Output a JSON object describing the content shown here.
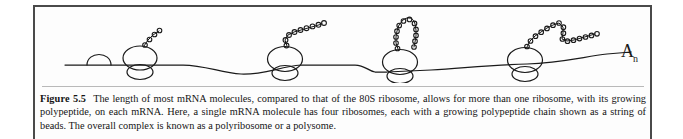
{
  "figure": {
    "label": "Figure 5.5",
    "caption_text": "The length of most mRNA molecules, compared to that of the 80S ribosome, allows for more than one ribosome, with its growing polypeptide, on each mRNA. Here, a single mRNA molecule has four ribosomes, each with a growing polypeptide chain shown as a string of beads. The overall complex is known as a polyribosome or a polysome.",
    "frame_color": "#4a4a4a",
    "rule_color": "#b9b9b9",
    "ink_color": "#1a1a1a",
    "page_background": "#fdfdfd"
  },
  "diagram": {
    "type": "polyribosome-schematic",
    "mrna_label_base": "A",
    "mrna_label_subscript": "n",
    "mrna_label_title": "poly-A tail",
    "initiation_dome_title": "small ribosomal subunit scanning mRNA",
    "mrna_strand_title": "mRNA strand",
    "ribosome_count": 4,
    "ribosomes": [
      {
        "name": "ribosome-1",
        "x": 105,
        "beads": 4,
        "chain_shape": "short-diagonal",
        "title": "80S ribosome with short growing polypeptide"
      },
      {
        "name": "ribosome-2",
        "x": 250,
        "beads": 9,
        "chain_shape": "long-diagonal",
        "title": "80S ribosome with longer growing polypeptide"
      },
      {
        "name": "ribosome-3",
        "x": 365,
        "beads": 12,
        "chain_shape": "hairpin-fold",
        "title": "80S ribosome with folded growing polypeptide"
      },
      {
        "name": "ribosome-4",
        "x": 490,
        "beads": 18,
        "chain_shape": "zigzag-fold",
        "title": "80S ribosome with longest growing polypeptide"
      }
    ]
  }
}
